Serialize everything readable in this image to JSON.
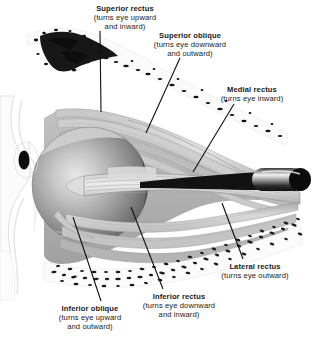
{
  "figure": {
    "width": 314,
    "height": 338,
    "background_color": "#ffffff"
  },
  "labels": [
    {
      "id": "superior-rectus",
      "name": "Superior rectus",
      "action_line_1": "(turns eye upward",
      "action_line_2": "and inward)",
      "x": 125,
      "y": 4,
      "leader": {
        "x1": 100,
        "y1": 31,
        "x2": 101,
        "y2": 112
      }
    },
    {
      "id": "superior-oblique",
      "name": "Superior oblique",
      "action_line_1": "(turns eye downward",
      "action_line_2": "and outward)",
      "x": 190,
      "y": 31,
      "leader": {
        "x1": 180,
        "y1": 58,
        "x2": 146,
        "y2": 133
      }
    },
    {
      "id": "medial-rectus",
      "name": "Medial rectus",
      "action_line_1": "(turns eye inward)",
      "action_line_2": "",
      "x": 252,
      "y": 85,
      "leader": {
        "x1": 234,
        "y1": 104,
        "x2": 193,
        "y2": 172
      }
    },
    {
      "id": "lateral-rectus",
      "name": "Lateral rectus",
      "action_line_1": "(turns eye outward)",
      "action_line_2": "",
      "x": 255,
      "y": 262,
      "leader": {
        "x1": 243,
        "y1": 259,
        "x2": 222,
        "y2": 203
      }
    },
    {
      "id": "inferior-rectus",
      "name": "Inferior rectus",
      "action_line_1": "(turns eye downward",
      "action_line_2": "and inward)",
      "x": 179,
      "y": 292,
      "leader": {
        "x1": 163,
        "y1": 289,
        "x2": 131,
        "y2": 207
      }
    },
    {
      "id": "inferior-oblique",
      "name": "Inferior oblique",
      "action_line_1": "(turns eye upward",
      "action_line_2": "and outward)",
      "x": 90,
      "y": 304,
      "leader": {
        "x1": 101,
        "y1": 301,
        "x2": 73,
        "y2": 217
      }
    }
  ],
  "structures": [
    {
      "id": "eyeball",
      "name": "Eyeball (globe)",
      "cx": 90,
      "cy": 185,
      "r": 58,
      "color": "#8d8d8d"
    },
    {
      "id": "pupil",
      "name": "Pupil",
      "cx": 24,
      "cy": 160,
      "color": "#101010"
    },
    {
      "id": "optic-nerve",
      "name": "Optic nerve",
      "color": "#1d1d1d"
    },
    {
      "id": "orbital-bone-superior",
      "name": "Superior orbital bone (marrow)",
      "color": "#1a1a1a"
    },
    {
      "id": "orbital-bone-inferior",
      "name": "Inferior orbital bone (trabecular)",
      "color": "#2a2a2a"
    },
    {
      "id": "eyelid",
      "name": "Eyelid / facial soft tissue",
      "color": "#f1f1f1"
    }
  ],
  "colors": {
    "line": "#1a1a1a",
    "muscle_light": "#d8d8d8",
    "muscle_mid": "#b8b8b8",
    "muscle_dark": "#9a9a9a",
    "globe_light": "#d2d2d2",
    "globe_dark": "#6f6f6f",
    "bone": "#e4e4e4",
    "background": "#ffffff"
  }
}
